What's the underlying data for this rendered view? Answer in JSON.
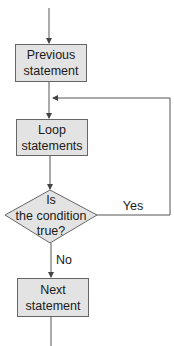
{
  "diagram": {
    "type": "flowchart",
    "nodes": [
      {
        "id": "previous",
        "shape": "rectangle",
        "line1": "Previous",
        "line2": "statement"
      },
      {
        "id": "loop",
        "shape": "rectangle",
        "line1": "Loop",
        "line2": "statements"
      },
      {
        "id": "condition",
        "shape": "diamond",
        "line1": "Is",
        "line2": "the condition",
        "line3": "true?"
      },
      {
        "id": "next",
        "shape": "rectangle",
        "line1": "Next",
        "line2": "statement"
      }
    ],
    "edges": [
      {
        "from": "start",
        "to": "previous",
        "label": ""
      },
      {
        "from": "previous",
        "to": "loop",
        "label": ""
      },
      {
        "from": "loop",
        "to": "condition",
        "label": ""
      },
      {
        "from": "condition",
        "to": "loop",
        "label": "Yes"
      },
      {
        "from": "condition",
        "to": "next",
        "label": "No"
      },
      {
        "from": "next",
        "to": "end",
        "label": ""
      }
    ],
    "labels": {
      "yes": "Yes",
      "no": "No"
    },
    "colors": {
      "box_fill": "#e3e3e3",
      "stroke": "#555555",
      "text": "#1a1a1a"
    }
  }
}
